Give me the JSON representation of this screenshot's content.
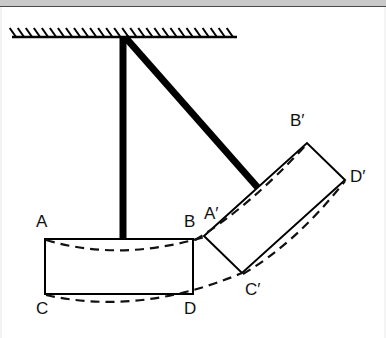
{
  "figure": {
    "background_color": "#ffffff",
    "stroke_color": "#000000",
    "rod_color": "#000000",
    "dashed_color": "#1a1a1a",
    "top_band_color": "#c9c9c9",
    "width": 386,
    "height": 338
  },
  "ceiling": {
    "name": "fixed-support-ceiling",
    "line": {
      "x1": 12,
      "y1": 37,
      "x2": 237,
      "y2": 37
    },
    "hatch_count": 28,
    "hatch_length": 11,
    "hatch_angle_deg": 55
  },
  "pivot": {
    "name": "pivot-point",
    "x": 123,
    "y": 37
  },
  "rods": [
    {
      "name": "vertical-rod",
      "x1": 123,
      "y1": 37,
      "x2": 123,
      "y2": 240,
      "thickness": 7
    },
    {
      "name": "diagonal-rod",
      "x1": 125,
      "y1": 37,
      "x2": 259,
      "y2": 189,
      "thickness": 7
    }
  ],
  "rectangle_original": {
    "name": "body-original-ABCD",
    "corners": {
      "A": {
        "x": 45,
        "y": 239
      },
      "B": {
        "x": 193,
        "y": 239
      },
      "D": {
        "x": 193,
        "y": 294
      },
      "C": {
        "x": 45,
        "y": 294
      }
    }
  },
  "rectangle_rotated": {
    "name": "body-rotated-ABCD-prime",
    "corners": {
      "A'": {
        "x": 204,
        "y": 236
      },
      "B'": {
        "x": 307,
        "y": 143
      },
      "D'": {
        "x": 345,
        "y": 180
      },
      "C'": {
        "x": 242,
        "y": 273
      }
    }
  },
  "dashed_arcs": [
    {
      "name": "arc-A-to-A-prime",
      "from": "A",
      "to": "A'",
      "path": "M 46,240 Q 120,262 204,237"
    },
    {
      "name": "arc-C-to-C-prime",
      "from": "C",
      "to": "C'",
      "path": "M 46,295 Q 140,316 242,273"
    },
    {
      "name": "arc-B-to-B-prime",
      "from": "B",
      "to": "B'",
      "path": "M 195,240 Q 248,208 307,144"
    },
    {
      "name": "arc-D-to-D-prime",
      "from": "D",
      "to": "D'",
      "path": "M 243,274 Q 296,243 345,181"
    }
  ],
  "labels": [
    {
      "id": "A",
      "text": "A",
      "x": 36,
      "y": 213,
      "name": "label-A"
    },
    {
      "id": "B",
      "text": "B",
      "x": 184,
      "y": 213,
      "name": "label-B"
    },
    {
      "id": "C",
      "text": "C",
      "x": 36,
      "y": 300,
      "name": "label-C"
    },
    {
      "id": "D",
      "text": "D",
      "x": 184,
      "y": 300,
      "name": "label-D"
    },
    {
      "id": "Ap",
      "text": "A′",
      "x": 204,
      "y": 205,
      "name": "label-A-prime"
    },
    {
      "id": "Bp",
      "text": "B′",
      "x": 290,
      "y": 112,
      "name": "label-B-prime"
    },
    {
      "id": "Cp",
      "text": "C′",
      "x": 245,
      "y": 281,
      "name": "label-C-prime"
    },
    {
      "id": "Dp",
      "text": "D′",
      "x": 350,
      "y": 168,
      "name": "label-D-prime"
    }
  ]
}
